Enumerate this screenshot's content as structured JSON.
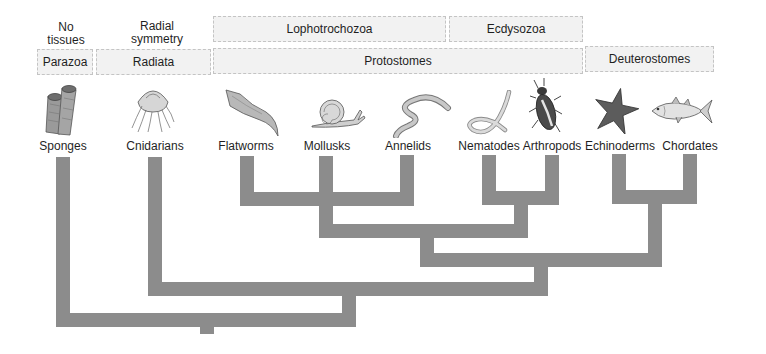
{
  "captions": [
    {
      "id": "no-tissues",
      "text": "No\ntissues"
    },
    {
      "id": "radial-symmetry",
      "text": "Radial\nsymmetry"
    }
  ],
  "group_boxes": {
    "upper": [
      {
        "id": "lophotrochozoa",
        "label": "Lophotrochozoa"
      },
      {
        "id": "ecdysozoa",
        "label": "Ecdysozoa"
      }
    ],
    "lower": [
      {
        "id": "parazoa",
        "label": "Parazoa"
      },
      {
        "id": "radiata",
        "label": "Radiata"
      },
      {
        "id": "protostomes",
        "label": "Protostomes"
      },
      {
        "id": "deuterostomes",
        "label": "Deuterostomes"
      }
    ]
  },
  "taxa": [
    {
      "id": "sponges",
      "label": "Sponges",
      "icon": "sponge-icon"
    },
    {
      "id": "cnidarians",
      "label": "Cnidarians",
      "icon": "jellyfish-icon"
    },
    {
      "id": "flatworms",
      "label": "Flatworms",
      "icon": "flatworm-icon"
    },
    {
      "id": "mollusks",
      "label": "Mollusks",
      "icon": "snail-icon"
    },
    {
      "id": "annelids",
      "label": "Annelids",
      "icon": "earthworm-icon"
    },
    {
      "id": "nematodes",
      "label": "Nematodes",
      "icon": "roundworm-icon"
    },
    {
      "id": "arthropods",
      "label": "Arthropods",
      "icon": "beetle-icon"
    },
    {
      "id": "echinoderms",
      "label": "Echinoderms",
      "icon": "sea-star-icon"
    },
    {
      "id": "chordates",
      "label": "Chordates",
      "icon": "fish-icon"
    }
  ],
  "tree": {
    "type": "cladogram",
    "branch_color": "#8c8c8c",
    "newick": "(Sponges,(Cnidarians,(((Flatworms,Mollusks,Annelids),(Nematodes,Arthropods)),(Echinoderms,Chordates))));"
  }
}
